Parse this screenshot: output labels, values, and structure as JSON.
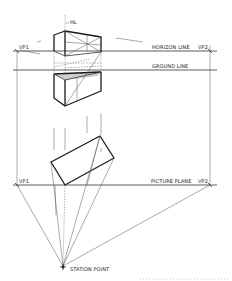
{
  "diagram": {
    "type": "two-point perspective construction",
    "labels": {
      "hl": "HL",
      "vp1_top": "VP1",
      "vp2_top": "VP2",
      "horizon_line": "HORIZON LINE",
      "ground_line": "GROUND LINE",
      "vp1_bottom": "VP1",
      "vp2_bottom": "VP2",
      "picture_plane": "PICTURE PLANE",
      "station_point": "STATION POINT"
    },
    "colors": {
      "background": "#ffffff",
      "ink": "#1a1a1a",
      "construction": "#555555",
      "shade": "#bbbbbb"
    }
  }
}
